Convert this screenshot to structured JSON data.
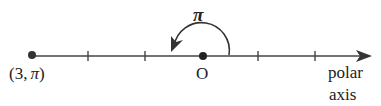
{
  "diagram": {
    "title": "",
    "point_label": "(3, π)",
    "point_label_prefix": "(3,",
    "point_label_angle": "π",
    "point_label_suffix": ")",
    "origin_label": "O",
    "angle_label": "π",
    "axis_label_line1": "polar",
    "axis_label_line2": "axis",
    "colors": {
      "stroke": "#333333",
      "text": "#222222",
      "background": "#ffffff"
    },
    "tick_count_left": 2,
    "tick_count_right": 2
  }
}
